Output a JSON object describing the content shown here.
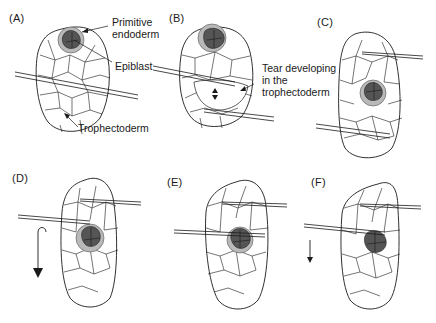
{
  "figure": {
    "panels": [
      {
        "id": "A",
        "label": "(A)"
      },
      {
        "id": "B",
        "label": "(B)"
      },
      {
        "id": "C",
        "label": "(C)"
      },
      {
        "id": "D",
        "label": "(D)"
      },
      {
        "id": "E",
        "label": "(E)"
      },
      {
        "id": "F",
        "label": "(F)"
      }
    ],
    "annotations": {
      "primitive_endoderm": "Primitive\nendoderm",
      "epiblast": "Epiblast",
      "trophectoderm": "Trophectoderm",
      "tear": "Tear developing\nin the\ntrophectoderm"
    },
    "colors": {
      "primitive_endoderm": "#b9b9b9",
      "inner_cell_mass": "#555555",
      "outline": "#1a1a1a"
    },
    "arrows": {
      "B": "double-headed vertical arrow (tear opening)",
      "D": "curved arrow pointing down (rotation)",
      "F": "straight arrow pointing down"
    }
  }
}
